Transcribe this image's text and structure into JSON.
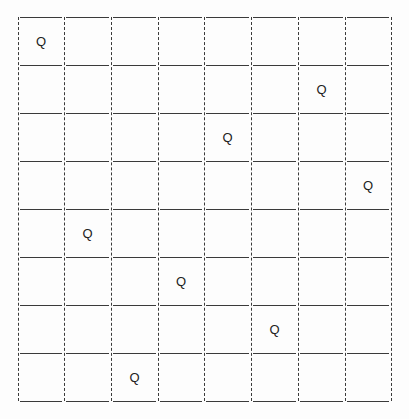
{
  "board": {
    "size": 8,
    "queen_label": "Q",
    "queens": [
      0,
      6,
      4,
      7,
      1,
      3,
      5,
      2
    ],
    "col_lines": [
      18,
      64,
      111,
      158,
      204,
      251,
      298,
      345,
      391
    ],
    "row_lines": [
      17,
      65,
      113,
      161,
      209,
      257,
      305,
      353,
      401
    ],
    "line_color": "#3a3a3a"
  }
}
